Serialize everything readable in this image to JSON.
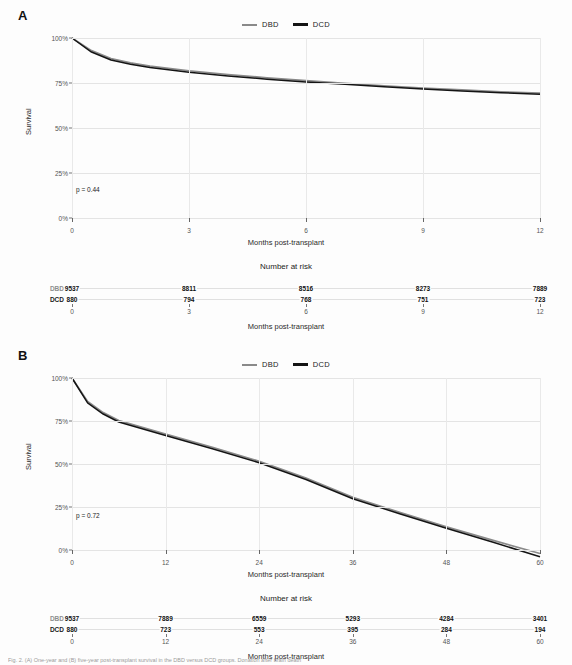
{
  "figure": {
    "caption_fragment": "Fig. 2. (A) One-year and (B) five-year post-transplant survival in the DBD versus DCD groups. Donation after brain death"
  },
  "legend": {
    "entries": [
      {
        "label": "DBD",
        "color": "#8a8a8a"
      },
      {
        "label": "DCD",
        "color": "#141414"
      }
    ]
  },
  "panels": [
    {
      "id": "A",
      "label": "A",
      "p_value_text": "p = 0.44",
      "y_axis_title": "Survival",
      "x_axis_title": "Months post-transplant",
      "risk_title": "Number at risk",
      "risk_x_axis_title": "Months post-transplant",
      "y_ticks": [
        "0%",
        "25%",
        "50%",
        "75%",
        "100%"
      ],
      "x_ticks": [
        "0",
        "3",
        "6",
        "9",
        "12"
      ],
      "risk_rows": [
        {
          "label": "DBD",
          "values": [
            "9537",
            "8811",
            "8516",
            "8273",
            "7889"
          ]
        },
        {
          "label": "DCD",
          "values": [
            "880",
            "794",
            "768",
            "751",
            "723"
          ]
        }
      ]
    },
    {
      "id": "B",
      "label": "B",
      "p_value_text": "p = 0.72",
      "y_axis_title": "Survival",
      "x_axis_title": "Months post-transplant",
      "risk_title": "Number at risk",
      "risk_x_axis_title": "Months post-transplant",
      "y_ticks": [
        "0%",
        "25%",
        "50%",
        "75%",
        "100%"
      ],
      "x_ticks": [
        "0",
        "12",
        "24",
        "36",
        "48",
        "60"
      ],
      "risk_rows": [
        {
          "label": "DBD",
          "values": [
            "9537",
            "7889",
            "6559",
            "5293",
            "4284",
            "3401"
          ]
        },
        {
          "label": "DCD",
          "values": [
            "880",
            "723",
            "553",
            "395",
            "284",
            "194"
          ]
        }
      ]
    }
  ],
  "chart_data": [
    {
      "type": "line",
      "title": "A",
      "subtitle": "One-year post-transplant survival",
      "xlabel": "Months post-transplant",
      "ylabel": "Survival",
      "xlim": [
        0,
        12
      ],
      "ylim": [
        0,
        100
      ],
      "xticks": [
        0,
        3,
        6,
        9,
        12
      ],
      "yticks": [
        0,
        25,
        50,
        75,
        100
      ],
      "ytick_labels": [
        "0%",
        "25%",
        "50%",
        "75%",
        "100%"
      ],
      "grid": true,
      "legend_position": "top-center",
      "annotations": [
        "p = 0.44"
      ],
      "x": [
        0,
        0.5,
        1,
        1.5,
        2,
        3,
        4,
        5,
        6,
        7,
        8,
        9,
        10,
        11,
        12
      ],
      "series": [
        {
          "name": "DBD",
          "color": "#8a8a8a",
          "values": [
            100.0,
            97.3,
            95.6,
            94.7,
            94.0,
            93.0,
            92.2,
            91.5,
            90.9,
            90.3,
            89.8,
            89.3,
            88.9,
            88.5,
            88.2
          ]
        },
        {
          "name": "DCD",
          "color": "#141414",
          "values": [
            100.0,
            97.0,
            95.3,
            94.4,
            93.7,
            92.7,
            91.9,
            91.2,
            90.6,
            90.1,
            89.6,
            89.1,
            88.7,
            88.3,
            88.0
          ]
        }
      ],
      "risk_table": {
        "times": [
          0,
          3,
          6,
          9,
          12
        ],
        "rows": [
          {
            "name": "DBD",
            "counts": [
              9537,
              8811,
              8516,
              8273,
              7889
            ]
          },
          {
            "name": "DCD",
            "counts": [
              880,
              794,
              768,
              751,
              723
            ]
          }
        ]
      }
    },
    {
      "type": "line",
      "title": "B",
      "subtitle": "Five-year post-transplant survival",
      "xlabel": "Months post-transplant",
      "ylabel": "Survival",
      "xlim": [
        0,
        60
      ],
      "ylim": [
        0,
        100
      ],
      "xticks": [
        0,
        12,
        24,
        36,
        48,
        60
      ],
      "yticks": [
        0,
        25,
        50,
        75,
        100
      ],
      "ytick_labels": [
        "0%",
        "25%",
        "50%",
        "75%",
        "100%"
      ],
      "grid": true,
      "legend_position": "top-center",
      "annotations": [
        "p = 0.72"
      ],
      "x": [
        0,
        2,
        4,
        6,
        12,
        18,
        24,
        30,
        36,
        42,
        48,
        54,
        60
      ],
      "series": [
        {
          "name": "DBD",
          "color": "#8a8a8a",
          "values": [
            100.0,
            95.0,
            92.6,
            90.9,
            88.0,
            85.2,
            82.2,
            78.6,
            74.5,
            71.3,
            68.2,
            65.3,
            62.5
          ]
        },
        {
          "name": "DCD",
          "color": "#141414",
          "values": [
            100.0,
            94.7,
            92.3,
            90.6,
            87.7,
            84.9,
            81.9,
            78.3,
            74.2,
            71.0,
            67.9,
            64.9,
            61.8
          ]
        }
      ],
      "risk_table": {
        "times": [
          0,
          12,
          24,
          36,
          48,
          60
        ],
        "rows": [
          {
            "name": "DBD",
            "counts": [
              9537,
              7889,
              6559,
              5293,
              4284,
              3401
            ]
          },
          {
            "name": "DCD",
            "counts": [
              880,
              723,
              553,
              395,
              284,
              194
            ]
          }
        ]
      }
    }
  ]
}
